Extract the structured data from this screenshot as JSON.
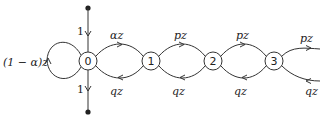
{
  "diagram": {
    "type": "state-transition-graph",
    "nodes": [
      {
        "id": "0",
        "label": "0"
      },
      {
        "id": "1",
        "label": "1"
      },
      {
        "id": "2",
        "label": "2"
      },
      {
        "id": "3",
        "label": "3"
      }
    ],
    "edges": {
      "in_top": {
        "label": "1"
      },
      "out_bottom": {
        "label": "1"
      },
      "self_loop_0": {
        "label": "(1 − α)z"
      },
      "e01": {
        "label": "αz"
      },
      "e10": {
        "label": "qz"
      },
      "e12": {
        "label": "pz"
      },
      "e21": {
        "label": "qz"
      },
      "e23": {
        "label": "pz"
      },
      "e32": {
        "label": "qz"
      },
      "e3_out": {
        "label": "pz"
      },
      "e_in_3": {
        "label": "qz"
      }
    }
  }
}
